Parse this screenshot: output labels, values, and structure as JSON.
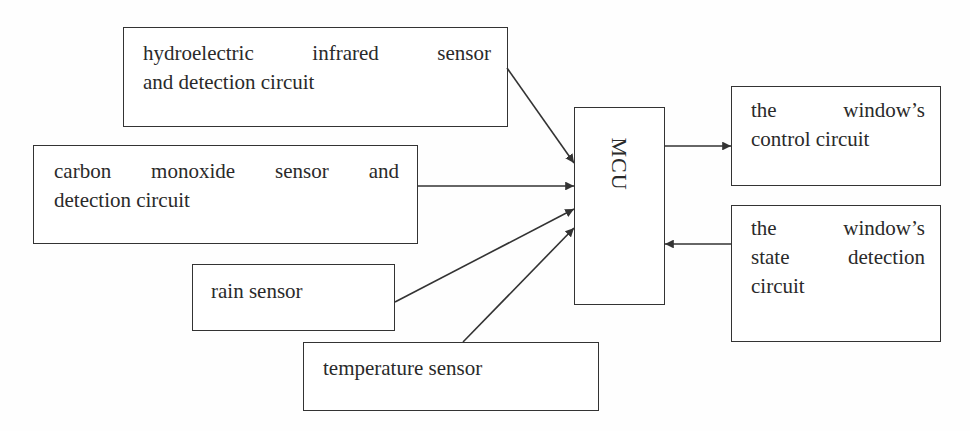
{
  "diagram": {
    "nodes": {
      "hydroelectric": {
        "line1": "hydroelectric infrared sensor",
        "line2": "and detection circuit"
      },
      "carbon_monoxide": {
        "line1": "carbon monoxide sensor and",
        "line2": "detection circuit"
      },
      "rain": {
        "line1": "rain sensor"
      },
      "temperature": {
        "line1": "temperature sensor"
      },
      "mcu": {
        "label": "MCU"
      },
      "window_control": {
        "line1": "the window’s",
        "line2": "control circuit"
      },
      "window_state": {
        "line1": "the window’s",
        "line2": "state detection",
        "line3": "circuit"
      }
    },
    "edges": [
      {
        "from": "hydroelectric",
        "to": "mcu"
      },
      {
        "from": "carbon_monoxide",
        "to": "mcu"
      },
      {
        "from": "rain",
        "to": "mcu"
      },
      {
        "from": "temperature",
        "to": "mcu"
      },
      {
        "from": "mcu",
        "to": "window_control"
      },
      {
        "from": "window_state",
        "to": "mcu"
      }
    ],
    "colors": {
      "line": "#333333",
      "text": "#2a2a2a",
      "background": "#ffffff"
    }
  }
}
